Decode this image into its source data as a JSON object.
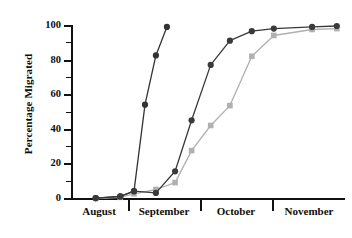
{
  "chart_data": {
    "type": "line",
    "title": "",
    "xlabel": "",
    "ylabel": "Percentage Migrated",
    "ylim": [
      0,
      100
    ],
    "yticks": [
      0,
      20,
      40,
      60,
      80,
      100
    ],
    "yminorticks": [
      10,
      30,
      50,
      70,
      90
    ],
    "grid": false,
    "legend": "none",
    "x_band_labels": [
      "August",
      "September",
      "October",
      "November"
    ],
    "x_axis_kind": "time-bands",
    "colors": {
      "series1": "#333333",
      "series2": "#3a3a3a",
      "series3": "#b0b0b0",
      "axis": "#111111",
      "background": "#ffffff"
    },
    "series": [
      {
        "name": "Series 1 (early)",
        "color": "#333333",
        "marker": "circle",
        "x": [
          9,
          18,
          23,
          27,
          31,
          35
        ],
        "values": [
          0.5,
          1.5,
          4.5,
          54.5,
          83,
          99.5
        ]
      },
      {
        "name": "Series 2 (middle)",
        "color": "#3a3a3a",
        "marker": "circle",
        "x": [
          9,
          18,
          23,
          31,
          38,
          44,
          51,
          58,
          66,
          74,
          88,
          97
        ],
        "values": [
          0.5,
          1.5,
          4.5,
          3.5,
          16,
          45.5,
          77.5,
          91.5,
          97,
          98.5,
          99.5,
          100
        ]
      },
      {
        "name": "Series 3 (late)",
        "color": "#b0b0b0",
        "marker": "square",
        "x": [
          9,
          18,
          23,
          31,
          38,
          44,
          51,
          58,
          66,
          74,
          88,
          97
        ],
        "values": [
          0.3,
          1.0,
          3.0,
          5.5,
          9.5,
          28,
          42.5,
          54,
          82.5,
          94.5,
          98,
          98.5
        ]
      }
    ]
  },
  "axis": {
    "y": {
      "ticks": [
        {
          "value": 100,
          "label": "100"
        },
        {
          "value": 90,
          "label": ""
        },
        {
          "value": 80,
          "label": "80"
        },
        {
          "value": 70,
          "label": ""
        },
        {
          "value": 60,
          "label": "60"
        },
        {
          "value": 50,
          "label": ""
        },
        {
          "value": 40,
          "label": "40"
        },
        {
          "value": 30,
          "label": ""
        },
        {
          "value": 20,
          "label": "20"
        },
        {
          "value": 10,
          "label": ""
        },
        {
          "value": 0,
          "label": "0"
        }
      ],
      "title": "Percentage Migrated"
    },
    "x": {
      "months": [
        {
          "label": "August",
          "center": 99
        },
        {
          "label": "September",
          "center": 164
        },
        {
          "label": "October",
          "center": 236
        },
        {
          "label": "November",
          "center": 309
        }
      ],
      "dividers": [
        128,
        200,
        272
      ]
    }
  }
}
